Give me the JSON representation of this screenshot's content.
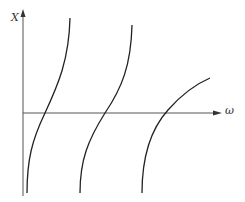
{
  "diagram": {
    "y_axis_label": "X",
    "x_axis_label": "ω",
    "colors": {
      "axis": "#555555",
      "curve": "#222222",
      "background": "#ffffff"
    },
    "curves": [
      {
        "name": "branch-1"
      },
      {
        "name": "branch-2"
      },
      {
        "name": "branch-3"
      }
    ]
  }
}
